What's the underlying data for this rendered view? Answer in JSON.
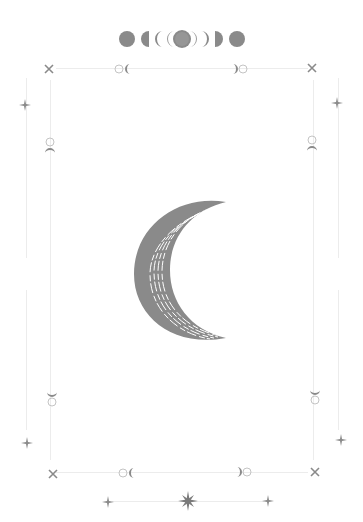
{
  "artwork": {
    "subject": "crescent moon with moon phases frame",
    "colors": {
      "primary": "#8a8a8a",
      "line": "#ececec",
      "light": "#c4c4c4",
      "background": "#ffffff"
    },
    "top_phases": [
      "new-moon",
      "waning-crescent",
      "crescent",
      "crescent-outline",
      "full-moon",
      "crescent-outline",
      "crescent",
      "waxing-gibbous",
      "new-moon"
    ],
    "center_icon": "crescent-moon",
    "corner_icon": "x-star",
    "side_icon": "four-point-star",
    "bottom_center_icon": "eight-point-star"
  }
}
